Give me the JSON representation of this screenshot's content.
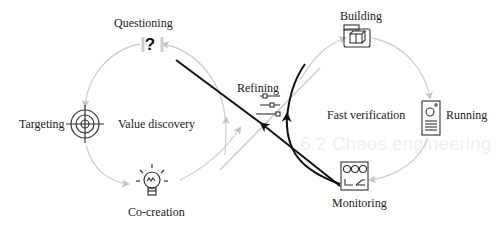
{
  "diagram": {
    "left_loop": {
      "name": "Value discovery",
      "nodes": [
        {
          "id": "questioning",
          "label": "Questioning",
          "icon": "question-mark-icon"
        },
        {
          "id": "targeting",
          "label": "Targeting",
          "icon": "target-icon"
        },
        {
          "id": "co-creation",
          "label": "Co-creation",
          "icon": "lightbulb-icon"
        }
      ]
    },
    "center": {
      "label": "Refining",
      "icon": "sliders-icon"
    },
    "right_loop": {
      "name": "Fast verification",
      "nodes": [
        {
          "id": "building",
          "label": "Building",
          "icon": "box-folder-icon"
        },
        {
          "id": "running",
          "label": "Running",
          "icon": "server-icon"
        },
        {
          "id": "monitoring",
          "label": "Monitoring",
          "icon": "dashboard-icon"
        }
      ]
    },
    "colors": {
      "loop_arrow": "#c8c8c8",
      "feedback_arrow": "#111111",
      "icon_stroke": "#333333",
      "text": "#222222"
    },
    "background_bleed": {
      "heading": "6.2 Chaos engineering"
    }
  }
}
